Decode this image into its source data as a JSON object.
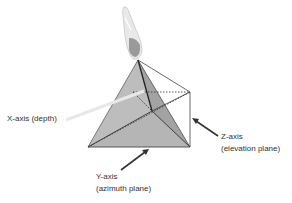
{
  "diagram": {
    "labels": {
      "x_axis": "X-axis (depth)",
      "z_axis_line1": "Z-axis",
      "z_axis_line2": "(elevation plane)",
      "y_axis_line1": "Y-axis",
      "y_axis_line2": "(azimuth plane)"
    },
    "colors": {
      "pyramid_fill": "#a9a9a9",
      "pyramid_fill_light": "#c4c4c4",
      "edge": "#333333",
      "beam": "#e6e6e6",
      "text": "#333333"
    },
    "elements": [
      "ultrasound-probe",
      "pyramid-volume",
      "x-axis-beam",
      "z-axis-arrow",
      "y-axis-arrow"
    ]
  }
}
